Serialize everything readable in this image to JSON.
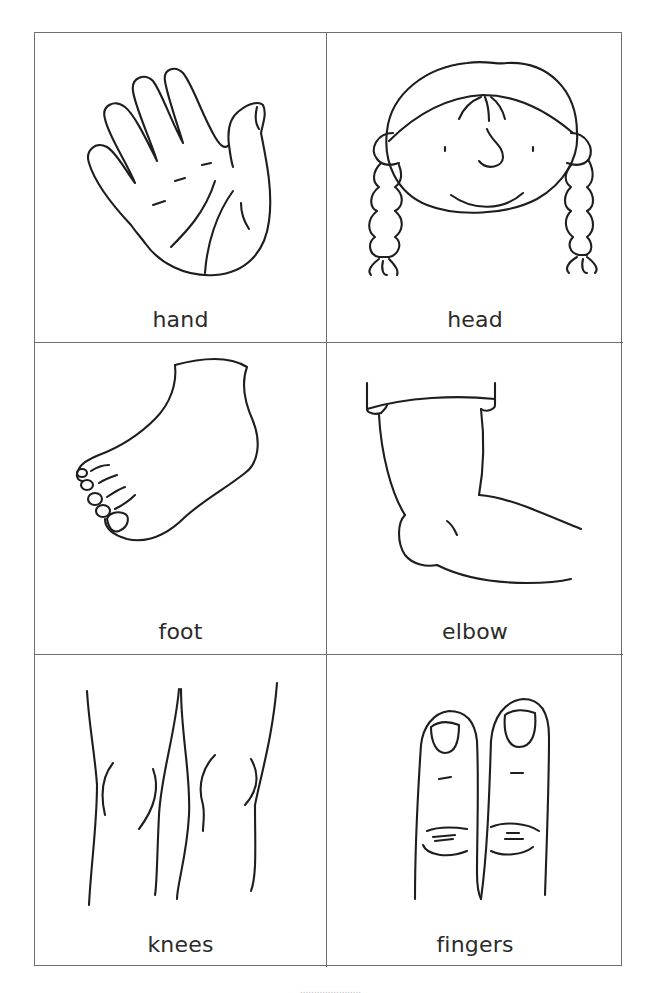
{
  "sheet": {
    "title": "Body parts picture cards",
    "cards": [
      {
        "label": "hand",
        "icon": "hand-illustration"
      },
      {
        "label": "head",
        "icon": "girl-head-illustration"
      },
      {
        "label": "foot",
        "icon": "foot-illustration"
      },
      {
        "label": "elbow",
        "icon": "elbow-illustration"
      },
      {
        "label": "knees",
        "icon": "knees-illustration"
      },
      {
        "label": "fingers",
        "icon": "fingers-illustration"
      }
    ]
  },
  "footer": {
    "text": "......................"
  },
  "colors": {
    "line": "#1e1e1e",
    "border": "#6e6e6e",
    "label": "#2b2b2b",
    "background": "#ffffff"
  }
}
